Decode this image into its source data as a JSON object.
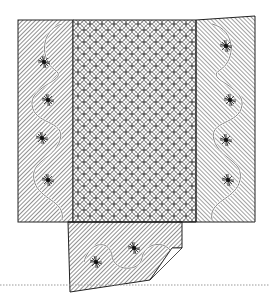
{
  "illustration": {
    "subject": "quilt line drawing",
    "panels": [
      "left-border",
      "center-field",
      "right-border",
      "bottom-flap"
    ],
    "center_pattern": "interlocking circles (orange peel) lattice",
    "border_pattern": "diagonal hatching with vine and flower motifs",
    "colors": {
      "ink": "#222222",
      "paper": "#ffffff",
      "rule": "#999999"
    }
  }
}
